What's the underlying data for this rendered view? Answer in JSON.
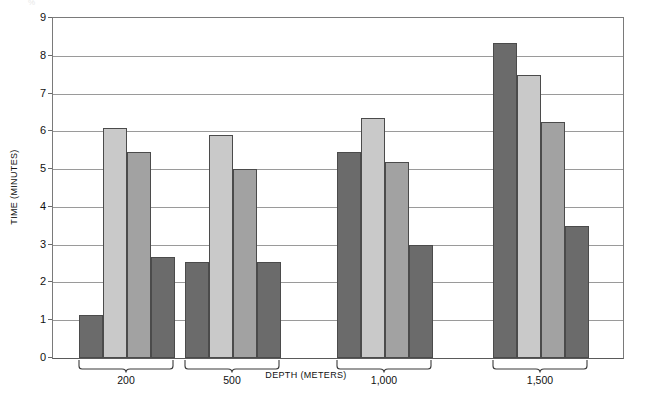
{
  "chart_data": {
    "type": "bar",
    "title": "",
    "xlabel": "DEPTH (METERS)",
    "ylabel": "TIME (MINUTES)",
    "categories": [
      "200",
      "500",
      "1,000",
      "1,500"
    ],
    "ylim": [
      0,
      9
    ],
    "ytick_labels": [
      "0",
      "1",
      "2",
      "3",
      "4",
      "5",
      "6",
      "7",
      "8",
      "9"
    ],
    "ytick_values": [
      0,
      1,
      2,
      3,
      4,
      5,
      6,
      7,
      8,
      9
    ],
    "grid": true,
    "legend": "none",
    "series": [
      {
        "name": "series-1",
        "color": "#6b6b6b",
        "values": [
          1.15,
          2.55,
          5.45,
          8.35
        ]
      },
      {
        "name": "series-2",
        "color": "#c9c9c9",
        "values": [
          6.1,
          5.9,
          6.35,
          7.5
        ]
      },
      {
        "name": "series-3",
        "color": "#a2a2a2",
        "values": [
          5.45,
          5.0,
          5.2,
          6.25
        ]
      },
      {
        "name": "series-4",
        "color": "#6b6b6b",
        "values": [
          2.68,
          2.55,
          3.0,
          3.5
        ]
      }
    ]
  },
  "chart": {
    "y_axis_title": "TIME (MINUTES)",
    "x_axis_title": "DEPTH (METERS)",
    "group_labels": [
      "200",
      "500",
      "1,000",
      "1,500"
    ],
    "top_artifact": "%"
  },
  "colors": {
    "bar_dark": "#6b6b6b",
    "bar_light": "#c9c9c9",
    "bar_medium": "#a2a2a2",
    "gridline": "#9a9a9a",
    "axis": "#7a7a7a",
    "text": "#111111"
  }
}
